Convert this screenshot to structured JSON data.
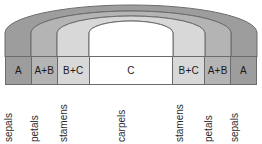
{
  "diagram": {
    "type": "concentric-arch-diagram",
    "background": "#ffffff",
    "arch": {
      "description": "Four nested half-arch bands representing floral whorls from outer to inner",
      "bands": [
        {
          "name": "sepals-band",
          "organ": "sepals",
          "fill": "#9d9d9d",
          "stroke": "#6b6b6b"
        },
        {
          "name": "petals-band",
          "organ": "petals",
          "fill": "#b4b4b4",
          "stroke": "#6b6b6b"
        },
        {
          "name": "stamens-band",
          "organ": "stamens",
          "fill": "#d8d8d8",
          "stroke": "#6b6b6b"
        },
        {
          "name": "carpels-band",
          "organ": "carpels",
          "fill": "#ffffff",
          "stroke": "#6b6b6b"
        }
      ]
    },
    "gene_cells": [
      {
        "label": "A",
        "fill": "#9d9d9d",
        "width": 26
      },
      {
        "label": "A+B",
        "fill": "#b4b4b4",
        "width": 26
      },
      {
        "label": "B+C",
        "fill": "#d8d8d8",
        "width": 32
      },
      {
        "label": "C",
        "fill": "#ffffff",
        "width": 84
      },
      {
        "label": "B+C",
        "fill": "#d8d8d8",
        "width": 32
      },
      {
        "label": "A+B",
        "fill": "#b4b4b4",
        "width": 26
      },
      {
        "label": "A",
        "fill": "#9d9d9d",
        "width": 26
      }
    ],
    "organ_labels": [
      {
        "label": "sepals",
        "width": 26
      },
      {
        "label": "petals",
        "width": 26
      },
      {
        "label": "stamens",
        "width": 32
      },
      {
        "label": "carpels",
        "width": 84
      },
      {
        "label": "stamens",
        "width": 32
      },
      {
        "label": "petals",
        "width": 26
      },
      {
        "label": "sepals",
        "width": 26
      }
    ]
  },
  "colors": {
    "band_outer": "#9d9d9d",
    "band_second": "#b4b4b4",
    "band_third": "#d8d8d8",
    "band_inner": "#ffffff",
    "stroke": "#6b6b6b",
    "text": "#1a1a1a"
  }
}
